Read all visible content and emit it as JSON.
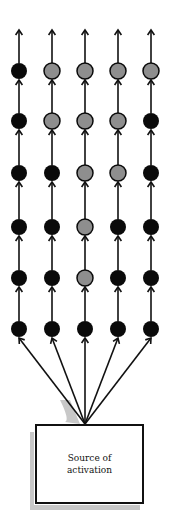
{
  "diagram": {
    "source_box": {
      "line1": "Source of",
      "line2": "activation"
    },
    "columns_x": [
      19,
      52,
      85,
      118,
      151
    ],
    "rows_y": [
      71,
      121,
      173,
      227,
      278,
      329
    ],
    "node_states": [
      [
        "black",
        "gray",
        "gray",
        "gray",
        "gray"
      ],
      [
        "black",
        "gray",
        "gray",
        "gray",
        "black"
      ],
      [
        "black",
        "black",
        "gray",
        "gray",
        "black"
      ],
      [
        "black",
        "black",
        "gray",
        "black",
        "black"
      ],
      [
        "black",
        "black",
        "gray",
        "black",
        "black"
      ],
      [
        "black",
        "black",
        "black",
        "black",
        "black"
      ]
    ],
    "colors": {
      "black": "#0a0a0a",
      "gray": "#8e8e8e",
      "line": "#111111",
      "shadow": "#c8c8c8"
    }
  }
}
